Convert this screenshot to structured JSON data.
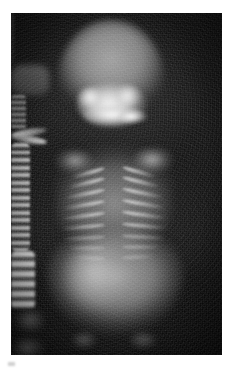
{
  "page": {
    "background_color": "#ffffff",
    "width": 233,
    "height": 369
  },
  "figure": {
    "type": "radiograph",
    "modality": "X-ray",
    "view": "anteroposterior",
    "film": {
      "left": 11,
      "top": 13,
      "width": 211,
      "height": 342,
      "background_color": "#0a0a0a",
      "border_color": "#000000"
    },
    "tone": {
      "film_base": "#0a0a0a",
      "soft_tissue": "#8c8c8c",
      "bone": "#d6d6d6",
      "dense_bone": "#f4f4f4"
    }
  },
  "anatomy": {
    "regions": [
      {
        "id": "cranium",
        "label": "Cranium",
        "brightness": "moderate"
      },
      {
        "id": "facial-bones",
        "label": "Facial bones",
        "brightness": "high"
      },
      {
        "id": "cervical-spine",
        "label": "Cervical spine",
        "brightness": "moderate"
      },
      {
        "id": "clavicles",
        "label": "Clavicles",
        "brightness": "high"
      },
      {
        "id": "thorax",
        "label": "Thorax",
        "brightness": "moderate"
      },
      {
        "id": "ribs",
        "label": "Ribs",
        "brightness": "high"
      },
      {
        "id": "thoracic-spine",
        "label": "Thoracic spine",
        "brightness": "high"
      },
      {
        "id": "abdomen",
        "label": "Abdomen",
        "brightness": "moderate"
      },
      {
        "id": "lumbar-spine",
        "label": "Lumbar spine",
        "brightness": "high"
      },
      {
        "id": "pelvis",
        "label": "Pelvis",
        "brightness": "low"
      },
      {
        "id": "lower-limbs",
        "label": "Lower limbs",
        "brightness": "low"
      }
    ],
    "ribs_left": [
      {
        "top": 158,
        "left": 60,
        "width": 34,
        "rotate": -16
      },
      {
        "top": 168,
        "left": 57,
        "width": 37,
        "rotate": -14
      },
      {
        "top": 179,
        "left": 54,
        "width": 40,
        "rotate": -12
      },
      {
        "top": 190,
        "left": 52,
        "width": 42,
        "rotate": -10
      },
      {
        "top": 201,
        "left": 51,
        "width": 43,
        "rotate": -8
      },
      {
        "top": 212,
        "left": 51,
        "width": 43,
        "rotate": -5
      },
      {
        "top": 223,
        "left": 53,
        "width": 41,
        "rotate": -3
      },
      {
        "top": 233,
        "left": 57,
        "width": 37,
        "rotate": 0
      },
      {
        "top": 243,
        "left": 63,
        "width": 31,
        "rotate": 3
      }
    ],
    "ribs_right": [
      {
        "top": 157,
        "left": 111,
        "width": 34,
        "rotate": 16
      },
      {
        "top": 167,
        "left": 111,
        "width": 38,
        "rotate": 14
      },
      {
        "top": 178,
        "left": 111,
        "width": 41,
        "rotate": 12
      },
      {
        "top": 189,
        "left": 111,
        "width": 43,
        "rotate": 10
      },
      {
        "top": 200,
        "left": 111,
        "width": 44,
        "rotate": 8
      },
      {
        "top": 211,
        "left": 111,
        "width": 44,
        "rotate": 5
      },
      {
        "top": 222,
        "left": 111,
        "width": 42,
        "rotate": 3
      },
      {
        "top": 232,
        "left": 111,
        "width": 38,
        "rotate": 0
      },
      {
        "top": 242,
        "left": 111,
        "width": 32,
        "rotate": -3
      }
    ]
  }
}
